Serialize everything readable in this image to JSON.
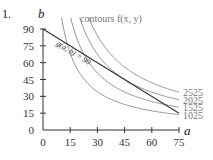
{
  "problem_number": "1.",
  "chart_data": {
    "type": "line",
    "title": "contours f(x, y)",
    "xlabel": "a",
    "ylabel": "b",
    "xlim": [
      0,
      75
    ],
    "ylim": [
      0,
      90
    ],
    "x_ticks": [
      0,
      15,
      30,
      45,
      60,
      75
    ],
    "y_ticks": [
      0,
      15,
      30,
      45,
      60,
      75,
      90
    ],
    "grid": false,
    "constraint": {
      "label": "g(a, b) = 90",
      "equation": "a + b = 90",
      "points": [
        [
          0,
          90
        ],
        [
          75,
          15
        ]
      ]
    },
    "series": [
      {
        "name": "1025",
        "level": 1025,
        "equation": "a*b = 1025"
      },
      {
        "name": "1525",
        "level": 1525,
        "equation": "a*b = 1525"
      },
      {
        "name": "2025",
        "level": 2025,
        "equation": "a*b = 2025"
      },
      {
        "name": "2525",
        "level": 2525,
        "equation": "a*b = 2525"
      }
    ]
  }
}
